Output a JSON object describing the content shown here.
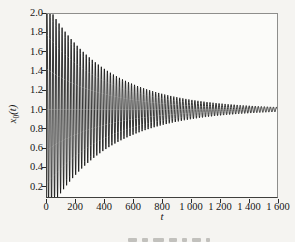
{
  "figure": {
    "xlabel": "t",
    "ylabel": {
      "base": "x",
      "sub": "0",
      "suffix": "(t)"
    }
  },
  "chart_data": {
    "type": "line",
    "title": "",
    "xlabel": "t",
    "ylabel": "x_0(t)",
    "xlim": [
      0,
      1600
    ],
    "ylim": [
      0.083,
      2.0
    ],
    "grid": false,
    "legend_position": "none",
    "x_tick_values": [
      0,
      200,
      400,
      600,
      800,
      1000,
      1200,
      1400,
      1600
    ],
    "x_tick_labels": [
      "0",
      "200",
      "400",
      "600",
      "800",
      "1 000",
      "1 200",
      "1 400",
      "1 600"
    ],
    "y_tick_values": [
      0.2,
      0.4,
      0.6,
      0.8,
      1.0,
      1.2,
      1.4,
      1.6,
      1.8,
      2.0
    ],
    "y_tick_labels": [
      "0.2",
      "0.4",
      "0.6",
      "0.8",
      "1.0",
      "1.2",
      "1.4",
      "1.6",
      "1.8",
      "2.0"
    ],
    "series": [
      {
        "name": "x_0(t) damped oscillation",
        "model": "x(t) = baseline + initial_amplitude * exp(-t/decay_tau) * cos(2*pi*t/period)",
        "baseline": 1.0,
        "initial_amplitude": 1.1,
        "decay_tau": 420,
        "period": 21,
        "t_start": 0,
        "t_end": 1600,
        "clipped_to_axes": true,
        "color": "#121212",
        "envelope_samples": {
          "t": [
            0,
            400,
            800,
            1200,
            1600
          ],
          "upper": [
            2.0,
            1.36,
            1.16,
            1.07,
            1.03
          ],
          "lower": [
            0.08,
            0.64,
            0.84,
            0.93,
            0.97
          ]
        }
      }
    ]
  },
  "colors": {
    "background": "#f5f4f1",
    "plot_background": "#fbfbf9",
    "frame_light": "#8e8e8c",
    "frame_dark": "#3f3f3d",
    "tick": "#2b2b2b",
    "text": "#161616",
    "waveform": "#121212",
    "caption_fragment": "#c2c1bd"
  }
}
